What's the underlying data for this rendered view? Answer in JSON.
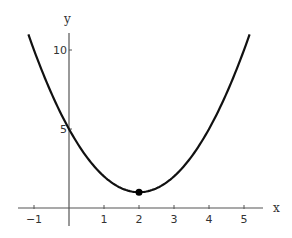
{
  "chart_data": {
    "type": "line",
    "title": "",
    "function": "y = (x - 2)^2 + 1",
    "xlabel": "x",
    "ylabel": "y",
    "xlim": [
      -1.2,
      5.5
    ],
    "ylim": [
      -1,
      11.5
    ],
    "x_ticks": [
      -1,
      1,
      2,
      3,
      4,
      5
    ],
    "x_tick_labels": [
      "-1",
      "1",
      "2",
      "3",
      "4",
      "5"
    ],
    "y_ticks": [
      5,
      10
    ],
    "y_tick_labels": [
      "5",
      "10"
    ],
    "grid": false,
    "series": [
      {
        "name": "parabola",
        "x": [
          -1.16,
          -1,
          -0.5,
          0,
          0.5,
          1,
          1.5,
          2,
          2.5,
          3,
          3.5,
          4,
          4.5,
          5,
          5.16
        ],
        "y": [
          11,
          10,
          7.25,
          5,
          3.25,
          2,
          1.25,
          1,
          1.25,
          2,
          3.25,
          5,
          7.25,
          10,
          11
        ]
      }
    ],
    "annotations": [
      {
        "type": "point",
        "x": 2,
        "y": 1,
        "label": "vertex (minimum)"
      }
    ],
    "colors": {
      "curve": "#111111",
      "axes": "#555555",
      "point": "#000000"
    }
  },
  "labels": {
    "x_axis": "x",
    "y_axis": "y",
    "x_ticks": [
      "-1",
      "1",
      "2",
      "3",
      "4",
      "5"
    ],
    "y_ticks": [
      "5",
      "10"
    ]
  }
}
